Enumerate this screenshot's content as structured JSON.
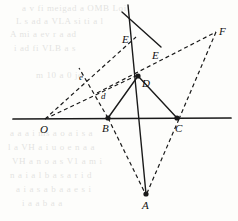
{
  "figure": {
    "width": 238,
    "height": 221,
    "background_color": "#fdfdfb",
    "stroke_color": "#1a1a1a",
    "points": [
      {
        "id": "O",
        "label": "O",
        "x": 45,
        "y": 119,
        "label_x": 40,
        "label_y": 124,
        "marked": false,
        "size": "big"
      },
      {
        "id": "B",
        "label": "B",
        "x": 108,
        "y": 118,
        "label_x": 102,
        "label_y": 123,
        "marked": true,
        "size": "big"
      },
      {
        "id": "C",
        "label": "C",
        "x": 177,
        "y": 118,
        "label_x": 175,
        "label_y": 123,
        "marked": true,
        "size": "big"
      },
      {
        "id": "A",
        "label": "A",
        "x": 146,
        "y": 194,
        "label_x": 142,
        "label_y": 200,
        "marked": true,
        "size": "big"
      },
      {
        "id": "D",
        "label": "D",
        "x": 138,
        "y": 76,
        "label_x": 142,
        "label_y": 78,
        "marked": true,
        "size": "big"
      },
      {
        "id": "E",
        "label": "E",
        "x": 133,
        "y": 40,
        "label_x": 122,
        "label_y": 34,
        "marked": false,
        "size": "big"
      },
      {
        "id": "E2",
        "label": "E",
        "x": 150,
        "y": 56,
        "label_x": 152,
        "label_y": 50,
        "marked": false,
        "size": "big"
      },
      {
        "id": "F",
        "label": "F",
        "x": 216,
        "y": 32,
        "label_x": 219,
        "label_y": 26,
        "marked": false,
        "size": "big"
      },
      {
        "id": "d",
        "label": "d",
        "x": 101,
        "y": 95,
        "label_x": 101,
        "label_y": 92,
        "marked": false,
        "size": "small"
      },
      {
        "id": "e",
        "label": "e",
        "x": 81,
        "y": 77,
        "label_x": 79,
        "label_y": 73,
        "marked": false,
        "size": "small"
      }
    ],
    "solid_segments": [
      {
        "name": "baseline-O-C-extended",
        "x1": 13,
        "y1": 119,
        "x2": 231,
        "y2": 118,
        "width": 1.7
      },
      {
        "name": "segment-B-D",
        "x1": 108,
        "y1": 118,
        "x2": 138,
        "y2": 76,
        "width": 1.4
      },
      {
        "name": "segment-D-C",
        "x1": 138,
        "y1": 76,
        "x2": 177,
        "y2": 118,
        "width": 1.4
      },
      {
        "name": "line-A-through-D-up",
        "x1": 146,
        "y1": 194,
        "x2": 128,
        "y2": 5,
        "width": 1.4
      },
      {
        "name": "line-steep-through-E",
        "x1": 122,
        "y1": 12,
        "x2": 161,
        "y2": 47,
        "width": 1.4
      }
    ],
    "dashed_segments": [
      {
        "name": "dashed-O-to-E-upper",
        "x1": 45,
        "y1": 119,
        "x2": 136,
        "y2": 37,
        "width": 1.2
      },
      {
        "name": "dashed-O-to-D",
        "x1": 45,
        "y1": 119,
        "x2": 140,
        "y2": 74,
        "width": 1.2
      },
      {
        "name": "dashed-E2-to-F",
        "x1": 97,
        "y1": 93,
        "x2": 216,
        "y2": 32,
        "width": 1.2
      },
      {
        "name": "dashed-B-to-e",
        "x1": 108,
        "y1": 118,
        "x2": 79,
        "y2": 68,
        "width": 1.2
      },
      {
        "name": "dashed-F-to-C",
        "x1": 216,
        "y1": 32,
        "x2": 179,
        "y2": 119,
        "width": 1.2
      },
      {
        "name": "dashed-C-to-A",
        "x1": 179,
        "y1": 119,
        "x2": 147,
        "y2": 193,
        "width": 1.2
      },
      {
        "name": "dashed-B-to-A",
        "x1": 108,
        "y1": 118,
        "x2": 145,
        "y2": 193,
        "width": 1.2
      }
    ],
    "background_text": [
      {
        "text": "a  v  fi  meigad  a  OMB  Loi",
        "x": 22,
        "y": 3
      },
      {
        "text": "L  s  ad  a  VLA  si  ti  a  l",
        "x": 16,
        "y": 16
      },
      {
        "text": "A  mi  a  ev  r  a  ad",
        "x": 10,
        "y": 29
      },
      {
        "text": "i  ad  fi  VLB  a  s",
        "x": 14,
        "y": 43
      },
      {
        "text": "m  10  a  0  jo",
        "x": 36,
        "y": 70
      },
      {
        "text": "a  a  a  i  ms  a  o  a  i  s  a",
        "x": 10,
        "y": 128
      },
      {
        "text": "l  a  VH  a  i  u  o  e  n  a  a",
        "x": 8,
        "y": 142
      },
      {
        "text": "VH  a  n  o  a  s  V1  a  m  i",
        "x": 12,
        "y": 156
      },
      {
        "text": "n  a  i  a  l  b  a  s  a  r  i  d",
        "x": 10,
        "y": 170
      },
      {
        "text": "a  i  a  s  a  b  a  a  e  s  i",
        "x": 16,
        "y": 184
      },
      {
        "text": "i  a  a  b  a  a",
        "x": 22,
        "y": 198
      }
    ]
  }
}
